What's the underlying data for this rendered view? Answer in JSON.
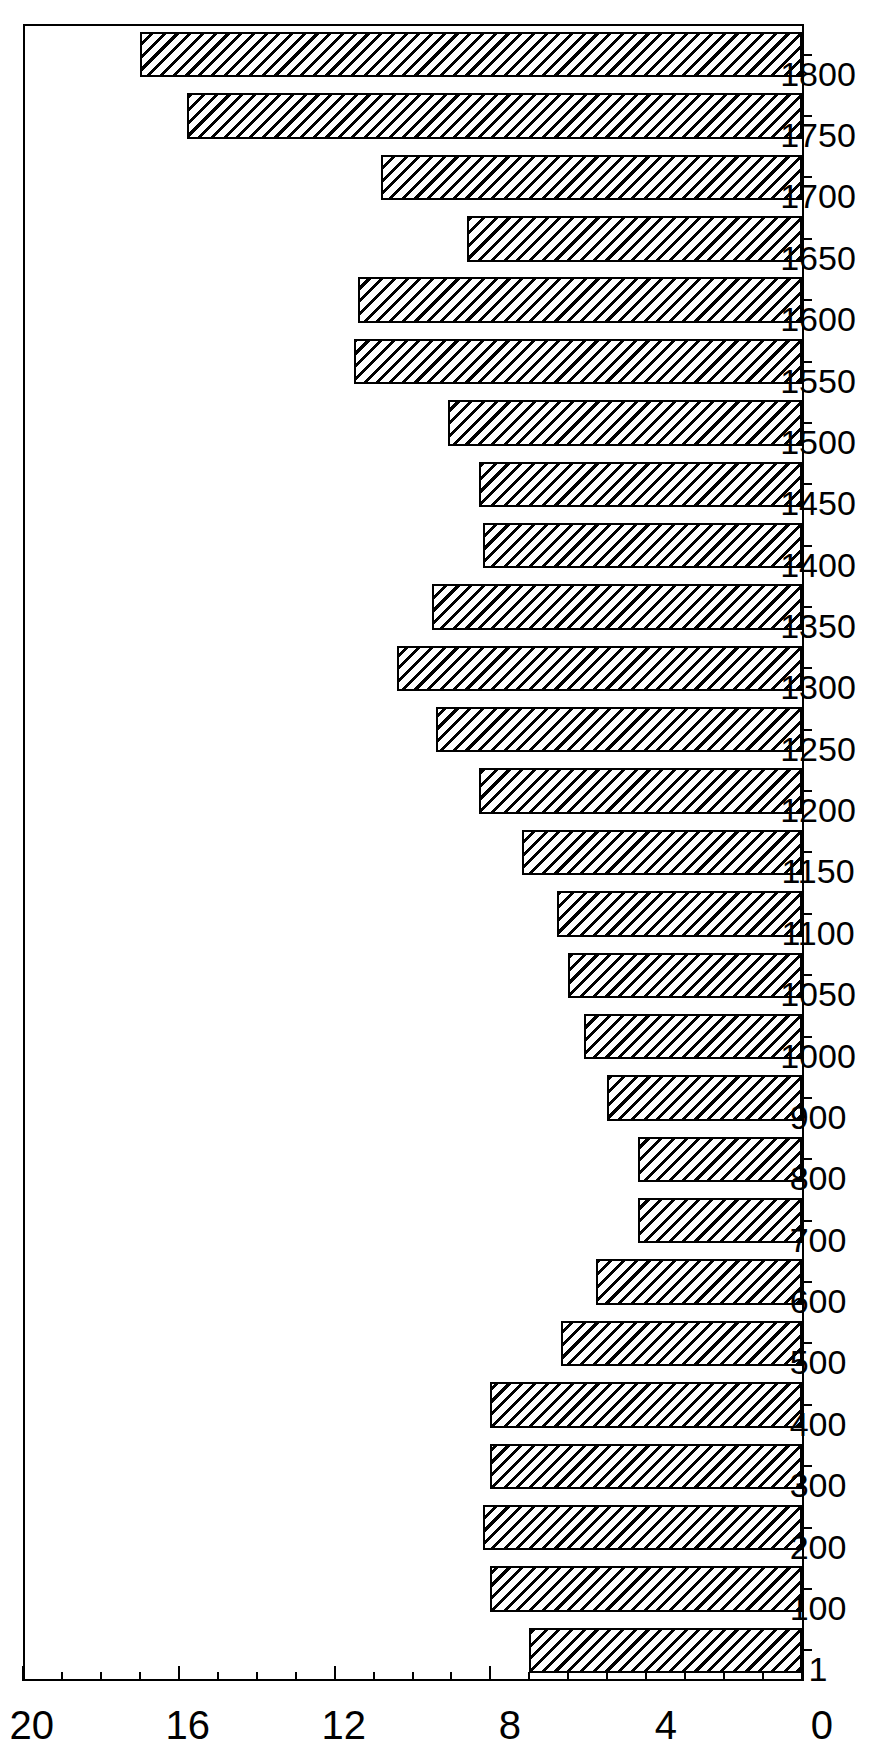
{
  "figure": {
    "kind": "bar-chart",
    "orientation": "rotated-90-ccw",
    "background": "#ffffff",
    "ink": "#000000"
  },
  "axes": {
    "value_axis_labels": [
      "20",
      "16",
      "12",
      "8",
      "4",
      "0"
    ],
    "value_axis_ticks_major": [
      20,
      16,
      12,
      8,
      4,
      0
    ],
    "value_axis_min": 0,
    "value_axis_max": 20,
    "value_axis_minor_step": 1,
    "value_axis_major_step": 4,
    "category_axis_labels": [
      "1",
      "100",
      "200",
      "300",
      "400",
      "500",
      "600",
      "700",
      "800",
      "900",
      "1000",
      "1050",
      "1100",
      "1150",
      "1200",
      "1250",
      "1300",
      "1350",
      "1400",
      "1450",
      "1500",
      "1550",
      "1600",
      "1650",
      "1700",
      "1750",
      "1800"
    ]
  },
  "chart_data": {
    "type": "bar",
    "title": "",
    "subtitle": "",
    "xlabel": "",
    "ylabel": "",
    "orientation": "vertical-bars-drawn-sideways",
    "grid": false,
    "legend": null,
    "ylim": [
      0,
      20
    ],
    "ytick_labels": [
      "0",
      "4",
      "8",
      "12",
      "16",
      "20"
    ],
    "ytick_values": [
      0,
      4,
      8,
      12,
      16,
      20
    ],
    "categories": [
      "1",
      "100",
      "200",
      "300",
      "400",
      "500",
      "600",
      "700",
      "800",
      "900",
      "1000",
      "1050",
      "1100",
      "1150",
      "1200",
      "1250",
      "1300",
      "1350",
      "1400",
      "1450",
      "1500",
      "1550",
      "1600",
      "1650",
      "1700",
      "1750",
      "1800"
    ],
    "values": [
      7.0,
      8.0,
      8.2,
      8.0,
      8.0,
      6.2,
      5.3,
      4.2,
      4.2,
      5.0,
      5.6,
      6.0,
      6.3,
      7.2,
      8.3,
      9.4,
      10.4,
      9.5,
      8.2,
      8.3,
      9.1,
      11.5,
      11.4,
      8.6,
      10.8,
      15.8,
      17.0
    ],
    "series": [
      {
        "name": "",
        "values": [
          7.0,
          8.0,
          8.2,
          8.0,
          8.0,
          6.2,
          5.3,
          4.2,
          4.2,
          5.0,
          5.6,
          6.0,
          6.3,
          7.2,
          8.3,
          9.4,
          10.4,
          9.5,
          8.2,
          8.3,
          9.1,
          11.5,
          11.4,
          8.6,
          10.8,
          15.8,
          17.0
        ]
      }
    ]
  }
}
